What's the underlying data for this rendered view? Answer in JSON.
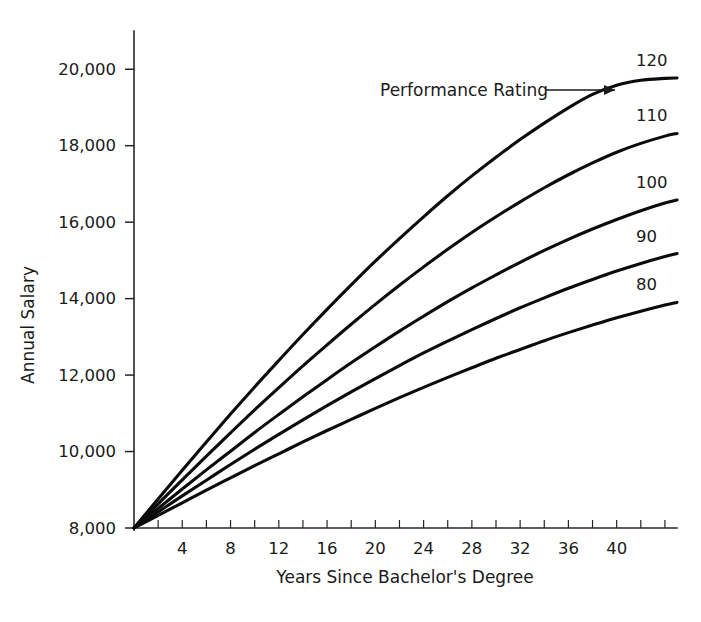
{
  "chart_data": {
    "type": "line",
    "title": "",
    "xlabel": "Years Since Bachelor's Degree",
    "ylabel": "Annual Salary",
    "xlim": [
      0,
      45
    ],
    "ylim": [
      8000,
      21000
    ],
    "grid": false,
    "legend_position": "right-of-curve-ends",
    "annotations": [
      {
        "text": "Performance Rating",
        "arrow": "right-arrow-icon"
      }
    ],
    "x_tick_labels": [
      "4",
      "8",
      "12",
      "16",
      "20",
      "24",
      "28",
      "32",
      "36",
      "40"
    ],
    "x_tick_values": [
      4,
      8,
      12,
      16,
      20,
      24,
      28,
      32,
      36,
      40
    ],
    "x_minor_step": 2,
    "y_tick_labels": [
      "8,000",
      "10,000",
      "12,000",
      "14,000",
      "16,000",
      "18,000",
      "20,000"
    ],
    "y_tick_values": [
      8000,
      10000,
      12000,
      14000,
      16000,
      18000,
      20000
    ],
    "x": [
      0,
      2,
      4,
      6,
      8,
      10,
      12,
      14,
      16,
      18,
      20,
      22,
      24,
      26,
      28,
      30,
      32,
      34,
      36,
      38,
      40,
      42,
      44,
      45
    ],
    "series": [
      {
        "name": "120",
        "label": "120",
        "color": "#0b0b0b",
        "values": [
          8000,
          8760,
          9510,
          10250,
          10980,
          11690,
          12380,
          13060,
          13720,
          14360,
          14980,
          15570,
          16140,
          16690,
          17210,
          17700,
          18160,
          18590,
          18990,
          19340,
          19580,
          19710,
          19760,
          19770
        ]
      },
      {
        "name": "110",
        "label": "110",
        "color": "#0b0b0b",
        "values": [
          8000,
          8630,
          9260,
          9880,
          10490,
          11090,
          11670,
          12240,
          12790,
          13330,
          13850,
          14350,
          14830,
          15290,
          15730,
          16140,
          16530,
          16900,
          17240,
          17550,
          17830,
          18060,
          18250,
          18320
        ]
      },
      {
        "name": "100",
        "label": "100",
        "color": "#0b0b0b",
        "values": [
          8000,
          8510,
          9020,
          9520,
          10010,
          10500,
          10970,
          11430,
          11880,
          12320,
          12740,
          13150,
          13540,
          13920,
          14280,
          14620,
          14950,
          15260,
          15550,
          15820,
          16070,
          16300,
          16500,
          16580
        ]
      },
      {
        "name": "90",
        "label": "90",
        "color": "#0b0b0b",
        "values": [
          8000,
          8420,
          8840,
          9250,
          9660,
          10060,
          10450,
          10830,
          11200,
          11560,
          11910,
          12250,
          12580,
          12890,
          13190,
          13480,
          13760,
          14020,
          14270,
          14500,
          14720,
          14920,
          15100,
          15180
        ]
      },
      {
        "name": "80",
        "label": "80",
        "color": "#0b0b0b",
        "values": [
          8000,
          8330,
          8660,
          8990,
          9310,
          9630,
          9940,
          10250,
          10550,
          10840,
          11130,
          11410,
          11680,
          11940,
          12190,
          12440,
          12670,
          12900,
          13110,
          13310,
          13500,
          13670,
          13830,
          13900
        ]
      }
    ],
    "end_labels": [
      {
        "series": "120",
        "value": 19770
      },
      {
        "series": "110",
        "value": 18320
      },
      {
        "series": "100",
        "value": 16580
      },
      {
        "series": "90",
        "value": 15180
      },
      {
        "series": "80",
        "value": 13900
      }
    ]
  }
}
